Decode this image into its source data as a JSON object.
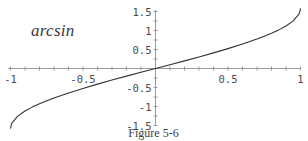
{
  "figure": {
    "function_label": "arcsin",
    "caption": "Figure 5-6"
  },
  "chart_data": {
    "type": "line",
    "title": "arcsin",
    "caption": "Figure 5-6",
    "xlabel": "",
    "ylabel": "",
    "xlim": [
      -1.12,
      1.05
    ],
    "ylim": [
      -1.62,
      1.62
    ],
    "grid": false,
    "legend": "none",
    "series": [
      {
        "name": "arcsin",
        "x": [
          -1.0,
          -0.99,
          -0.97,
          -0.95,
          -0.9,
          -0.85,
          -0.8,
          -0.75,
          -0.7,
          -0.6,
          -0.5,
          -0.4,
          -0.3,
          -0.2,
          -0.1,
          0.0,
          0.1,
          0.2,
          0.3,
          0.4,
          0.5,
          0.6,
          0.7,
          0.75,
          0.8,
          0.85,
          0.9,
          0.95,
          0.97,
          0.99,
          1.0
        ],
        "y": [
          -1.5708,
          -1.4287,
          -1.3453,
          -1.2532,
          -1.1198,
          -1.0162,
          -0.9273,
          -0.8481,
          -0.7754,
          -0.6435,
          -0.5236,
          -0.4115,
          -0.3047,
          -0.2014,
          -0.1002,
          0.0,
          0.1002,
          0.2014,
          0.3047,
          0.4115,
          0.5236,
          0.6435,
          0.7754,
          0.8481,
          0.9273,
          1.0162,
          1.1198,
          1.2532,
          1.3453,
          1.4287,
          1.5708
        ]
      }
    ],
    "x_ticks": [
      {
        "value": -1,
        "label": "-1"
      },
      {
        "value": -0.5,
        "label": "-0.5"
      },
      {
        "value": 0.5,
        "label": "0.5"
      },
      {
        "value": 1,
        "label": "1"
      }
    ],
    "y_ticks": [
      {
        "value": 1.5,
        "label": "1.5"
      },
      {
        "value": 1,
        "label": "1"
      },
      {
        "value": 0.5,
        "label": "0.5"
      },
      {
        "value": -0.5,
        "label": "-0.5"
      },
      {
        "value": -1,
        "label": "-1"
      },
      {
        "value": -1.5,
        "label": "-1.5"
      }
    ],
    "x_minor_ticks": [
      -1.0,
      -0.9,
      -0.8,
      -0.7,
      -0.6,
      -0.5,
      -0.4,
      -0.3,
      -0.2,
      -0.1,
      0.1,
      0.2,
      0.3,
      0.4,
      0.5,
      0.6,
      0.7,
      0.8,
      0.9,
      1.0
    ],
    "y_minor_ticks": [
      -1.5,
      -1.25,
      -1.0,
      -0.75,
      -0.5,
      -0.25,
      0.25,
      0.5,
      0.75,
      1.0,
      1.25,
      1.5
    ],
    "colors": {
      "curve": "#333333",
      "axis": "#9a9a9a",
      "text": "#4a4a4a",
      "background": "#ffffff"
    }
  }
}
